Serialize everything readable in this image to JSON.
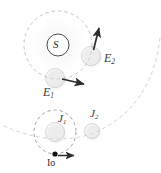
{
  "figure": {
    "background_color": "#ffffff",
    "width": 161,
    "height": 173,
    "label_color": "#3a3a3a",
    "sphere_color": "#d8d8d8",
    "orbit_color": "#c9c9c9",
    "arrow_color": "#2c2c2c"
  },
  "bodies": {
    "sun": {
      "label": "S",
      "name": "sun",
      "cx": 58,
      "cy": 45,
      "r": 11
    },
    "earth_1": {
      "label": "E",
      "subscript": "1",
      "name": "earth-position-1",
      "cx": 55,
      "cy": 78,
      "r": 9.5
    },
    "earth_2": {
      "label": "E",
      "subscript": "2",
      "name": "earth-position-2",
      "cx": 91,
      "cy": 56,
      "r": 9.5
    },
    "jupiter_1": {
      "label": "J",
      "subscript": "1",
      "name": "jupiter-position-1",
      "cx": 55,
      "cy": 132,
      "r": 9.5
    },
    "jupiter_2": {
      "label": "J",
      "subscript": "2",
      "name": "jupiter-position-2",
      "cx": 92,
      "cy": 131,
      "r": 7.5
    },
    "io": {
      "label": "Io",
      "name": "io-moon",
      "cx": 55,
      "cy": 154,
      "r": 2.4
    }
  },
  "orbits": {
    "earth_orbit": {
      "name": "earth-orbit",
      "cx": 58,
      "cy": 45,
      "r": 34,
      "style": "dashed"
    },
    "io_orbit": {
      "name": "io-orbit",
      "cx": 55,
      "cy": 132,
      "rx": 21,
      "ry": 22,
      "style": "dashed"
    },
    "jupiter_orbit_arc": {
      "name": "jupiter-orbit-arc",
      "style": "dashed"
    }
  },
  "vectors": {
    "earth_1_velocity": {
      "name": "earth-1-velocity-arrow",
      "from": [
        62,
        79
      ],
      "to": [
        86,
        84
      ],
      "direction": "right-down"
    },
    "earth_2_velocity": {
      "name": "earth-2-velocity-arrow",
      "from": [
        93,
        50
      ],
      "to": [
        99,
        26
      ],
      "direction": "up-right"
    },
    "io_velocity": {
      "name": "io-velocity-arrow",
      "from": [
        58,
        156
      ],
      "to": [
        76,
        156
      ],
      "direction": "right"
    }
  },
  "labels": {
    "sun": "S",
    "earth_1": "E",
    "earth_1_sub": "1",
    "earth_2": "E",
    "earth_2_sub": "2",
    "jupiter_1": "J",
    "jupiter_1_sub": "1",
    "jupiter_2": "J",
    "jupiter_2_sub": "2",
    "io": "Io"
  }
}
